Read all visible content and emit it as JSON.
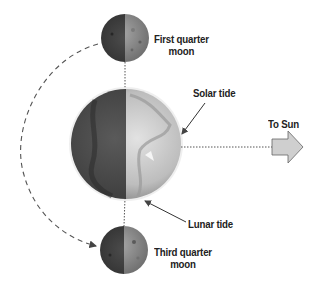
{
  "diagram": {
    "labels": {
      "first_quarter_line1": "First quarter",
      "first_quarter_line2": "moon",
      "third_quarter_line1": "Third quarter",
      "third_quarter_line2": "moon",
      "solar_tide": "Solar tide",
      "lunar_tide": "Lunar tide",
      "to_sun": "To Sun"
    },
    "bodies": [
      {
        "name": "First quarter moon",
        "cx": 125,
        "cy": 38,
        "r": 24
      },
      {
        "name": "Earth",
        "cx": 126,
        "cy": 144,
        "r": 55
      },
      {
        "name": "Third quarter moon",
        "cx": 124,
        "cy": 250,
        "r": 24
      }
    ],
    "colors": {
      "background": "#ffffff",
      "dark_side": "#4a4a4a",
      "lit_side": "#c8c8c8",
      "arrow_fill": "#cfcfcf",
      "text": "#222222",
      "line": "#555555"
    }
  }
}
